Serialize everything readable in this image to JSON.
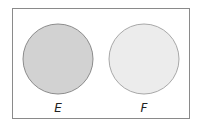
{
  "diagram": {
    "type": "venn-disjoint",
    "frame": {
      "stroke": "#8a8a8a"
    },
    "sets": [
      {
        "label": "E",
        "fill": "#d2d2d2",
        "stroke": "#8c8c8c"
      },
      {
        "label": "F",
        "fill": "#ececec",
        "stroke": "#a8a8a8"
      }
    ]
  }
}
